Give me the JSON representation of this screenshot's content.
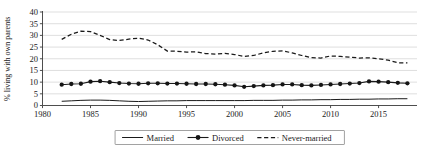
{
  "chart_data": {
    "type": "line",
    "title": "",
    "xlabel": "",
    "ylabel": "% living with own parents",
    "xlim": [
      1980,
      2019
    ],
    "ylim": [
      0,
      40
    ],
    "grid": true,
    "legend_position": "bottom-center",
    "xticks": [
      1980,
      1985,
      1990,
      1995,
      2000,
      2005,
      2010,
      2015
    ],
    "xtick_labels": [
      "1980",
      "1985",
      "1990",
      "1995",
      "2000",
      "2005",
      "2010",
      "2015"
    ],
    "yticks": [
      0,
      5,
      10,
      15,
      20,
      25,
      30,
      35,
      40
    ],
    "ytick_labels": [
      "0",
      "5",
      "10",
      "15",
      "20",
      "25",
      "30",
      "35",
      "40"
    ],
    "x": [
      1982,
      1983,
      1984,
      1985,
      1986,
      1987,
      1988,
      1989,
      1990,
      1991,
      1992,
      1993,
      1994,
      1995,
      1996,
      1997,
      1998,
      1999,
      2000,
      2001,
      2002,
      2003,
      2004,
      2005,
      2006,
      2007,
      2008,
      2009,
      2010,
      2011,
      2012,
      2013,
      2014,
      2015,
      2016,
      2017,
      2018
    ],
    "series": [
      {
        "name": "Married",
        "style": "solid",
        "marker": "none",
        "color": "#1a1a1a",
        "values": [
          1.8,
          2.0,
          2.2,
          2.3,
          2.3,
          2.2,
          2.0,
          1.8,
          1.7,
          1.8,
          1.9,
          2.0,
          2.0,
          2.1,
          2.1,
          2.1,
          2.1,
          2.1,
          2.1,
          2.1,
          2.2,
          2.2,
          2.2,
          2.3,
          2.3,
          2.4,
          2.4,
          2.5,
          2.5,
          2.6,
          2.6,
          2.7,
          2.7,
          2.8,
          2.8,
          2.9,
          2.9
        ]
      },
      {
        "name": "Divorced",
        "style": "solid",
        "marker": "filled-circle",
        "color": "#1a1a1a",
        "values": [
          8.9,
          9.2,
          9.3,
          10.2,
          10.4,
          10.0,
          9.6,
          9.4,
          9.3,
          9.5,
          9.5,
          9.4,
          9.4,
          9.3,
          9.2,
          9.2,
          9.1,
          8.9,
          8.6,
          8.0,
          8.3,
          8.6,
          8.7,
          9.0,
          9.0,
          8.7,
          8.6,
          8.8,
          9.0,
          9.2,
          9.4,
          9.6,
          10.3,
          10.2,
          10.0,
          9.7,
          9.5
        ]
      },
      {
        "name": "Never-married",
        "style": "dashed",
        "marker": "none",
        "color": "#1a1a1a",
        "values": [
          28.3,
          30.5,
          31.8,
          31.6,
          30.0,
          28.2,
          27.8,
          28.4,
          28.8,
          28.0,
          26.0,
          23.3,
          23.2,
          22.8,
          23.0,
          22.2,
          22.0,
          22.3,
          21.8,
          21.0,
          21.4,
          22.5,
          23.2,
          23.4,
          22.5,
          21.4,
          20.5,
          20.3,
          21.2,
          21.0,
          20.7,
          20.3,
          20.4,
          20.0,
          19.4,
          18.3,
          18.2
        ]
      }
    ],
    "legend": [
      {
        "label": "Married",
        "style": "solid",
        "marker": "none"
      },
      {
        "label": "Divorced",
        "style": "solid",
        "marker": "filled-circle"
      },
      {
        "label": "Never-married",
        "style": "dashed",
        "marker": "none"
      }
    ]
  }
}
